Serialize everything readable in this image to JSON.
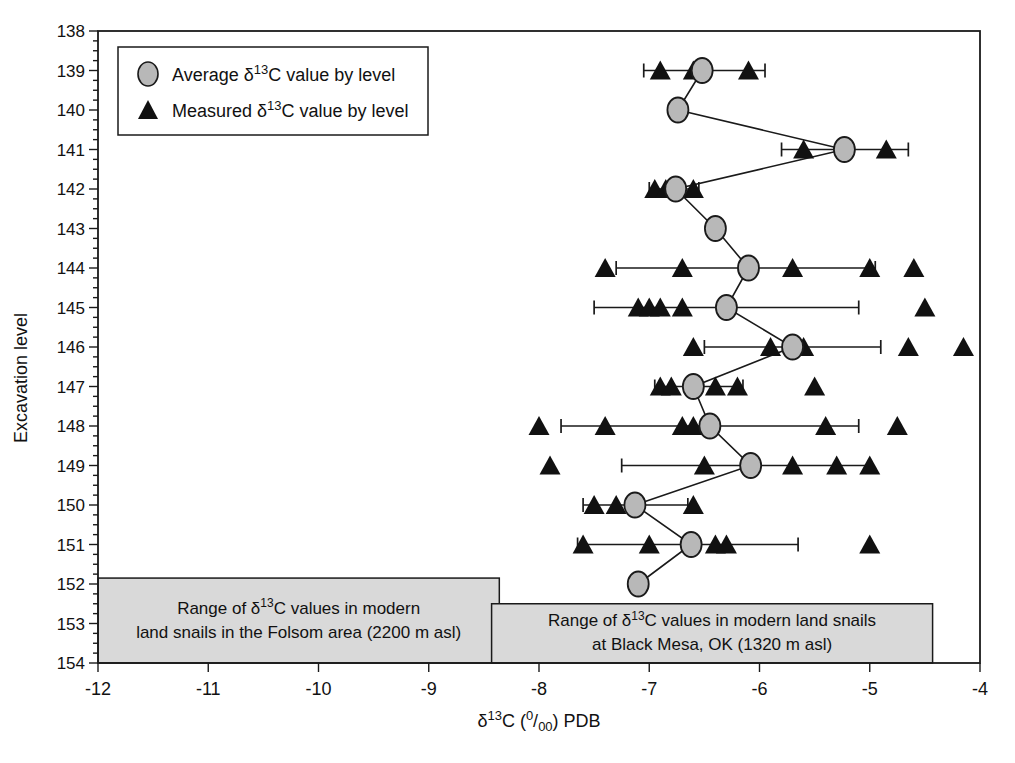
{
  "figure": {
    "width": 1015,
    "height": 763,
    "background": "#ffffff"
  },
  "colors": {
    "axis": "#1a1a1a",
    "text": "#111111",
    "average_fill": "#b8b8b8",
    "average_stroke": "#1a1a1a",
    "measured_fill": "#111111",
    "range_box_fill": "#d9d9d9",
    "range_box_stroke": "#1a1a1a",
    "legend_bg": "#ffffff"
  },
  "legend": {
    "items": [
      {
        "marker": "average-circle-marker",
        "label": "Average δ13C value by level",
        "label_rich": [
          {
            "t": "Average δ"
          },
          {
            "t": "13",
            "s": "sup"
          },
          {
            "t": "C value by level"
          }
        ]
      },
      {
        "marker": "measured-triangle-marker",
        "label": "Measured δ13C value by level",
        "label_rich": [
          {
            "t": "Measured δ"
          },
          {
            "t": "13",
            "s": "sup"
          },
          {
            "t": "C value by level"
          }
        ]
      }
    ]
  },
  "chart_data": {
    "type": "scatter",
    "title": "",
    "xlabel": "δ13C (0/00) PDB",
    "xlabel_rich": [
      {
        "t": "δ"
      },
      {
        "t": "13",
        "s": "sup"
      },
      {
        "t": "C ("
      },
      {
        "t": "0",
        "s": "sup"
      },
      {
        "t": "/"
      },
      {
        "t": "00",
        "s": "sub"
      },
      {
        "t": ") PDB"
      }
    ],
    "ylabel": "Excavation level",
    "xlim": [
      -12,
      -4
    ],
    "x_ticks": [
      -12,
      -11,
      -10,
      -9,
      -8,
      -7,
      -6,
      -5,
      -4
    ],
    "level_range": [
      138,
      154
    ],
    "y_ticks": [
      138,
      139,
      140,
      141,
      142,
      143,
      144,
      145,
      146,
      147,
      148,
      149,
      150,
      151,
      152,
      153,
      154
    ],
    "y_minor_step": 0.25,
    "grid": false,
    "legend_position": "top-left",
    "series": [
      {
        "name": "Average δ13C value by level",
        "marker": "circle"
      },
      {
        "name": "Measured δ13C value by level",
        "marker": "triangle"
      }
    ],
    "levels": [
      {
        "level": 139,
        "average": -6.52,
        "measured": [
          -6.9,
          -6.6,
          -6.1
        ],
        "range": [
          -7.05,
          -5.95
        ]
      },
      {
        "level": 140,
        "average": -6.74,
        "measured": [],
        "range": null
      },
      {
        "level": 141,
        "average": -5.23,
        "measured": [
          -5.6,
          -4.85
        ],
        "range": [
          -5.8,
          -4.65
        ]
      },
      {
        "level": 142,
        "average": -6.76,
        "measured": [
          -6.95,
          -6.85,
          -6.6
        ],
        "range": [
          -7.0,
          -6.55
        ]
      },
      {
        "level": 143,
        "average": -6.4,
        "measured": [],
        "range": null
      },
      {
        "level": 144,
        "average": -6.1,
        "measured": [
          -7.4,
          -6.7,
          -5.7,
          -5.0,
          -4.6
        ],
        "range": [
          -7.3,
          -4.95
        ]
      },
      {
        "level": 145,
        "average": -6.3,
        "measured": [
          -7.1,
          -7.0,
          -6.9,
          -6.7,
          -4.5
        ],
        "range": [
          -7.5,
          -5.1
        ]
      },
      {
        "level": 146,
        "average": -5.7,
        "measured": [
          -6.6,
          -5.9,
          -5.6,
          -4.65,
          -4.15
        ],
        "range": [
          -6.5,
          -4.9
        ]
      },
      {
        "level": 147,
        "average": -6.6,
        "measured": [
          -6.9,
          -6.8,
          -6.4,
          -6.2,
          -5.5
        ],
        "range": [
          -6.95,
          -6.15
        ]
      },
      {
        "level": 148,
        "average": -6.45,
        "measured": [
          -8.0,
          -7.4,
          -6.7,
          -6.6,
          -5.4,
          -4.75
        ],
        "range": [
          -7.8,
          -5.1
        ]
      },
      {
        "level": 149,
        "average": -6.08,
        "measured": [
          -7.9,
          -6.5,
          -5.7,
          -5.3,
          -5.0
        ],
        "range": [
          -7.25,
          -5.0
        ]
      },
      {
        "level": 150,
        "average": -7.13,
        "measured": [
          -7.5,
          -7.3,
          -6.6
        ],
        "range": [
          -7.6,
          -6.65
        ]
      },
      {
        "level": 151,
        "average": -6.62,
        "measured": [
          -7.6,
          -7.0,
          -6.4,
          -6.3,
          -5.0
        ],
        "range": [
          -7.65,
          -5.65
        ]
      },
      {
        "level": 152,
        "average": -7.1,
        "measured": [],
        "range": null
      }
    ],
    "annotation_boxes": [
      {
        "id": "folsom-range-box",
        "text": "Range of δ13C values in modern land snails in the Folsom area (2200 m asl)",
        "lines_rich": [
          [
            {
              "t": "Range of δ"
            },
            {
              "t": "13",
              "s": "sup"
            },
            {
              "t": "C values in modern"
            }
          ],
          [
            {
              "t": "land snails in the Folsom area (2200 m asl)"
            }
          ]
        ],
        "x_range": [
          -12,
          -8.36
        ],
        "level_range": [
          151.85,
          154
        ]
      },
      {
        "id": "black-mesa-range-box",
        "text": "Range of δ13C values in modern land snails at Black Mesa, OK (1320 m asl)",
        "lines_rich": [
          [
            {
              "t": "Range of δ"
            },
            {
              "t": "13",
              "s": "sup"
            },
            {
              "t": "C values in modern land snails"
            }
          ],
          [
            {
              "t": "at Black Mesa, OK (1320 m asl)"
            }
          ]
        ],
        "x_range": [
          -8.43,
          -4.43
        ],
        "level_range": [
          152.5,
          154
        ]
      }
    ]
  }
}
